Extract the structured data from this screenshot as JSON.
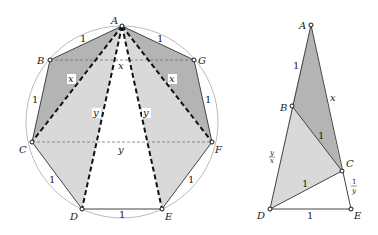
{
  "left_figure": {
    "vertices": {
      "A": {
        "label": "A",
        "x": 122,
        "y": 26
      },
      "B": {
        "label": "B",
        "x": 50,
        "y": 60
      },
      "C": {
        "label": "C",
        "x": 32,
        "y": 142
      },
      "D": {
        "label": "D",
        "x": 82,
        "y": 209
      },
      "E": {
        "label": "E",
        "x": 162,
        "y": 209
      },
      "F": {
        "label": "F",
        "x": 212,
        "y": 142
      },
      "G": {
        "label": "G",
        "x": 194,
        "y": 60
      }
    },
    "side_labels": {
      "AB": "1",
      "AG": "1",
      "BC": "1",
      "GF": "1",
      "CD": "1",
      "FE": "1",
      "DE": "1"
    },
    "diagonal_labels": {
      "BG": "x",
      "AC": "x",
      "AF": "x",
      "AD": "y",
      "AE": "y",
      "CF": "y"
    },
    "colors": {
      "dark_fill": "#b4b4b4",
      "light_fill": "#d9d9d9",
      "circle": "#aaaaaa",
      "edge": "#444444"
    }
  },
  "right_figure": {
    "vertices": {
      "A": {
        "label": "A",
        "x": 311,
        "y": 25
      },
      "B": {
        "label": "B",
        "x": 292,
        "y": 106
      },
      "C": {
        "label": "C",
        "x": 342,
        "y": 171
      },
      "D": {
        "label": "D",
        "x": 270,
        "y": 209
      },
      "E": {
        "label": "E",
        "x": 351,
        "y": 209
      }
    },
    "side_labels": {
      "AB": "1",
      "AC": "x",
      "BC": "1",
      "CD": "1",
      "DE": "1",
      "BD_num": "y",
      "BD_den": "x",
      "CE_num": "1",
      "CE_den": "y"
    }
  }
}
